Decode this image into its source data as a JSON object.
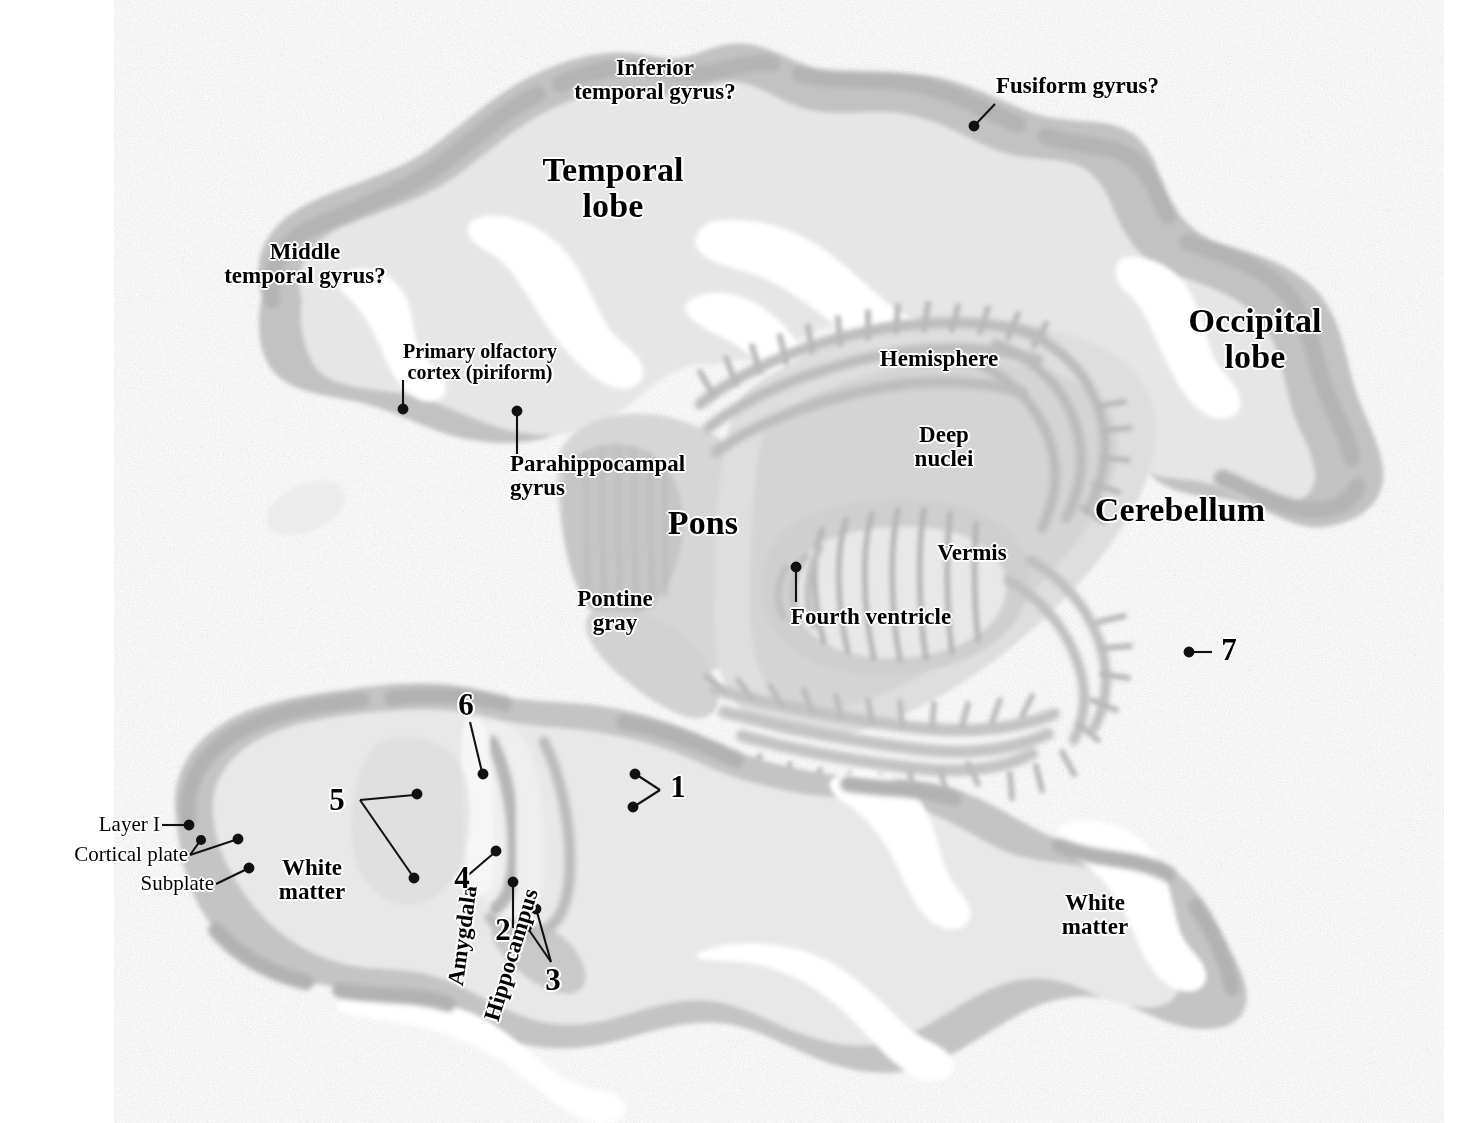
{
  "figure": {
    "background_color": "#ffffff",
    "tissue_light": "#e3e3e3",
    "tissue_mid": "#d2d2d2",
    "tissue_dark": "#b9b9b9",
    "label_color": "#000000",
    "halo_color": "#ffffff"
  },
  "labels": {
    "inferior_temporal_gyrus": "Inferior\ntemporal gyrus?",
    "fusiform_gyrus": "Fusiform gyrus?",
    "temporal_lobe": "Temporal\nlobe",
    "middle_temporal_gyrus": "Middle\ntemporal gyrus?",
    "primary_olfactory_cortex": "Primary olfactory\ncortex (piriform)",
    "parahippocampal_gyrus": "Parahippocampal\ngyrus",
    "occipital_lobe": "Occipital\nlobe",
    "hemisphere": "Hemisphere",
    "deep_nuclei": "Deep\nnuclei",
    "cerebellum": "Cerebellum",
    "vermis": "Vermis",
    "pons": "Pons",
    "pontine_gray": "Pontine\ngray",
    "fourth_ventricle": "Fourth ventricle",
    "amygdala": "Amygdala",
    "hippocampus": "Hippocampus",
    "layer_i": "Layer I",
    "cortical_plate": "Cortical plate",
    "subplate": "Subplate",
    "white_matter_left": "White\nmatter",
    "white_matter_right": "White\nmatter"
  },
  "callout_numbers": {
    "n1": "1",
    "n2": "2",
    "n3": "3",
    "n4": "4",
    "n5": "5",
    "n6": "6",
    "n7": "7"
  }
}
